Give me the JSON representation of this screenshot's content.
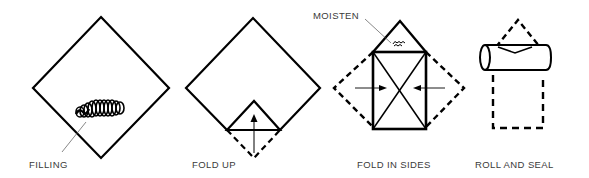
{
  "diagram": {
    "type": "process-steps",
    "colors": {
      "stroke": "#000000",
      "label": "#3a3a3a",
      "leader": "#555555",
      "background": "#ffffff"
    },
    "steps": [
      {
        "id": "filling",
        "label": "FILLING",
        "icon": "diamond-with-filling-icon"
      },
      {
        "id": "fold-up",
        "label": "FOLD UP",
        "icon": "diamond-fold-up-icon"
      },
      {
        "id": "fold-in-sides",
        "label": "FOLD IN SIDES",
        "icon": "fold-in-sides-icon",
        "annotation": "MOISTEN"
      },
      {
        "id": "roll-and-seal",
        "label": "ROLL AND SEAL",
        "icon": "roll-and-seal-icon"
      }
    ]
  }
}
